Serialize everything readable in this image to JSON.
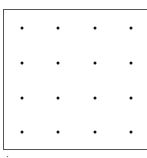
{
  "diagram": {
    "type": "dot-grid",
    "rows": 4,
    "columns": 4,
    "frame_color": "#555555",
    "dot_color": "#111111",
    "dots": [
      {
        "x": 22,
        "y": 28
      },
      {
        "x": 58,
        "y": 28
      },
      {
        "x": 95,
        "y": 28
      },
      {
        "x": 131,
        "y": 28
      },
      {
        "x": 22,
        "y": 63
      },
      {
        "x": 58,
        "y": 63
      },
      {
        "x": 95,
        "y": 63
      },
      {
        "x": 131,
        "y": 63
      },
      {
        "x": 22,
        "y": 98
      },
      {
        "x": 58,
        "y": 98
      },
      {
        "x": 95,
        "y": 98
      },
      {
        "x": 131,
        "y": 98
      },
      {
        "x": 22,
        "y": 132
      },
      {
        "x": 58,
        "y": 132
      },
      {
        "x": 95,
        "y": 132
      },
      {
        "x": 131,
        "y": 132
      }
    ],
    "caption": "·"
  }
}
